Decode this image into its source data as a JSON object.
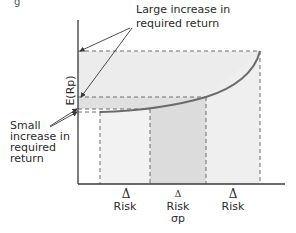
{
  "figure": {
    "top_fragment": "g",
    "annotations": {
      "large_increase": [
        "Large increase in",
        "required return"
      ],
      "small_increase": [
        "Small",
        "increase in",
        "required",
        "return"
      ]
    },
    "y_axis_label": "E(Rp)",
    "x_ticks": [
      {
        "delta": "Δ",
        "label": "Risk",
        "sub": ""
      },
      {
        "delta": "Δ",
        "label": "Risk",
        "sub": "σp"
      },
      {
        "delta": "Δ",
        "label": "Risk",
        "sub": ""
      }
    ],
    "colors": {
      "axis": "#3a3a3a",
      "curve": "#6b6b6b",
      "dashed": "#6e6e6e",
      "band_light": "#ececec",
      "band_mid": "#e3e3e3",
      "region_light": "#f1f1f1",
      "region_mid": "#dcdcdc",
      "arrow": "#3a3a3a"
    }
  }
}
